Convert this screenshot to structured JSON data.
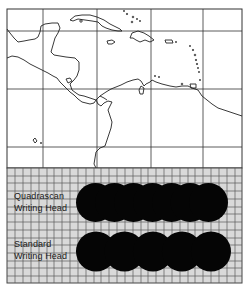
{
  "figure": {
    "map_region": "Caribbean Sea and Central America outline map with graticule",
    "comparison_panel": {
      "rows": [
        {
          "label_line1": "Quadrascan",
          "label_line2": "Writing Head",
          "dot_count": 7
        },
        {
          "label_line1": "Standard",
          "label_line2": "Writing Head",
          "dot_count": 5
        }
      ]
    },
    "colors": {
      "map_background": "#ffffff",
      "coastline": "#222222",
      "graticule": "#333333",
      "grid_background": "#d9d9d9",
      "grid_lines": "#555555",
      "dots": "#050505"
    }
  }
}
